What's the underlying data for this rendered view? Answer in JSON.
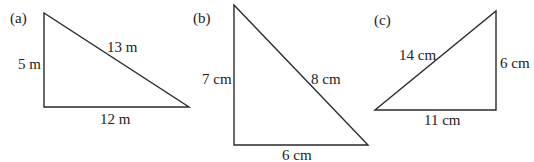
{
  "triangles": [
    {
      "id": "a",
      "label": "(a)",
      "vertical": "5 m",
      "hypotenuse": "13 m",
      "base": "12 m",
      "points": "44,13 44,107 189,107"
    },
    {
      "id": "b",
      "label": "(b)",
      "vertical": "7 cm",
      "hypotenuse": "8 cm",
      "base": "6 cm",
      "points": "234,5 234,145 368,145"
    },
    {
      "id": "c",
      "label": "(c)",
      "vertical": "6 cm",
      "hypotenuse": "14 cm",
      "base": "11 cm",
      "points": "375,110 496,11 496,110"
    }
  ],
  "style": {
    "stroke": "#2a2a2a"
  }
}
